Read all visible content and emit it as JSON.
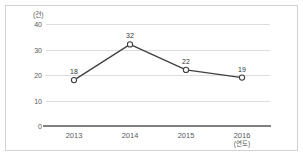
{
  "chart_data": {
    "type": "line",
    "title": "",
    "subtitle": "",
    "xlabel": "(연도)",
    "ylabel": "(건)",
    "categories": [
      "2013",
      "2014",
      "2015",
      "2016"
    ],
    "values": [
      18,
      32,
      22,
      19
    ],
    "series": [
      {
        "name": "건수",
        "values": [
          18,
          32,
          22,
          19
        ]
      }
    ],
    "point_labels": [
      "18",
      "32",
      "22",
      "19"
    ],
    "ylim": [
      0,
      40
    ],
    "yticks": [
      0,
      10,
      20,
      30,
      40
    ],
    "ytick_labels": [
      "0",
      "10",
      "20",
      "30",
      "40"
    ],
    "grid": true,
    "grid_axis": "y",
    "legend": false,
    "legend_position": "none",
    "marker": "open-circle",
    "colors": {
      "line": "#404040",
      "marker_fill": "#ffffff",
      "marker_stroke": "#404040",
      "gridline": "#dddddd",
      "axis": "#808080",
      "border": "#d2d2d2",
      "tick_text": "#595959",
      "label_text": "#333333",
      "background": "#ffffff"
    }
  }
}
